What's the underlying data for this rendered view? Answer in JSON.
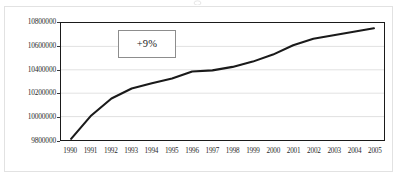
{
  "chart_data": {
    "type": "line",
    "title": "",
    "subtitle": "",
    "xlabel": "",
    "ylabel": "",
    "categories": [
      "1990",
      "1991",
      "1992",
      "1993",
      "1994",
      "1995",
      "1996",
      "1997",
      "1998",
      "1999",
      "2000",
      "2001",
      "2002",
      "2003",
      "2004",
      "2005"
    ],
    "values": [
      9810000,
      10010000,
      10155000,
      10240000,
      10285000,
      10325000,
      10385000,
      10395000,
      10425000,
      10470000,
      10530000,
      10610000,
      10665000,
      10695000,
      10725000,
      10755000
    ],
    "series": [
      {
        "name": "",
        "values": [
          9810000,
          10010000,
          10155000,
          10240000,
          10285000,
          10325000,
          10385000,
          10395000,
          10425000,
          10470000,
          10530000,
          10610000,
          10665000,
          10695000,
          10725000,
          10755000
        ]
      }
    ],
    "ylim": [
      9800000,
      10800000
    ],
    "ytick_values": [
      9800000,
      10000000,
      10200000,
      10400000,
      10600000,
      10800000
    ],
    "ytick_labels": [
      "9800000",
      "10000000",
      "10200000",
      "10400000",
      "10600000",
      "10800000"
    ],
    "xtick_labels": [
      "1990",
      "1991",
      "1992",
      "1993",
      "1994",
      "1995",
      "1996",
      "1997",
      "1998",
      "1999",
      "2000",
      "2001",
      "2002",
      "2003",
      "2004",
      "2005"
    ],
    "grid": true,
    "grid_axis": "y",
    "legend": false,
    "legend_position": "none",
    "line_color": "#1a1a1a",
    "grid_color": "#d9d9d9",
    "axis_color": "#1a1a1a",
    "plot_background": "#ffffff",
    "annotations": [
      {
        "text": "+9%",
        "type": "boxed-label",
        "border_color": "#8d8d8d"
      }
    ]
  }
}
